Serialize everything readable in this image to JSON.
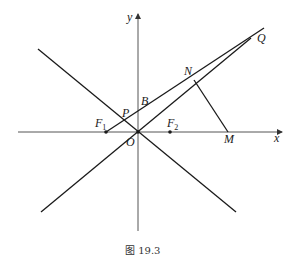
{
  "figure": {
    "caption": "图 19.3",
    "colors": {
      "line": "#1a1a1a",
      "axis": "#555555",
      "background": "#ffffff"
    }
  },
  "axes": {
    "x_label": "x",
    "y_label": "y",
    "origin_label": "O"
  },
  "points": {
    "F1": {
      "letter": "F",
      "sub": "1"
    },
    "F2": {
      "letter": "F",
      "sub": "2"
    },
    "P": {
      "label": "P"
    },
    "B": {
      "label": "B"
    },
    "N": {
      "label": "N"
    },
    "Q": {
      "label": "Q"
    },
    "M": {
      "label": "M"
    }
  },
  "elements": [
    "x-axis",
    "y-axis",
    "asymptote y = -kx",
    "asymptote y = kx (through O to Q)",
    "line F1-P-B-N-Q",
    "segment N-M perpendicular to OQ"
  ]
}
